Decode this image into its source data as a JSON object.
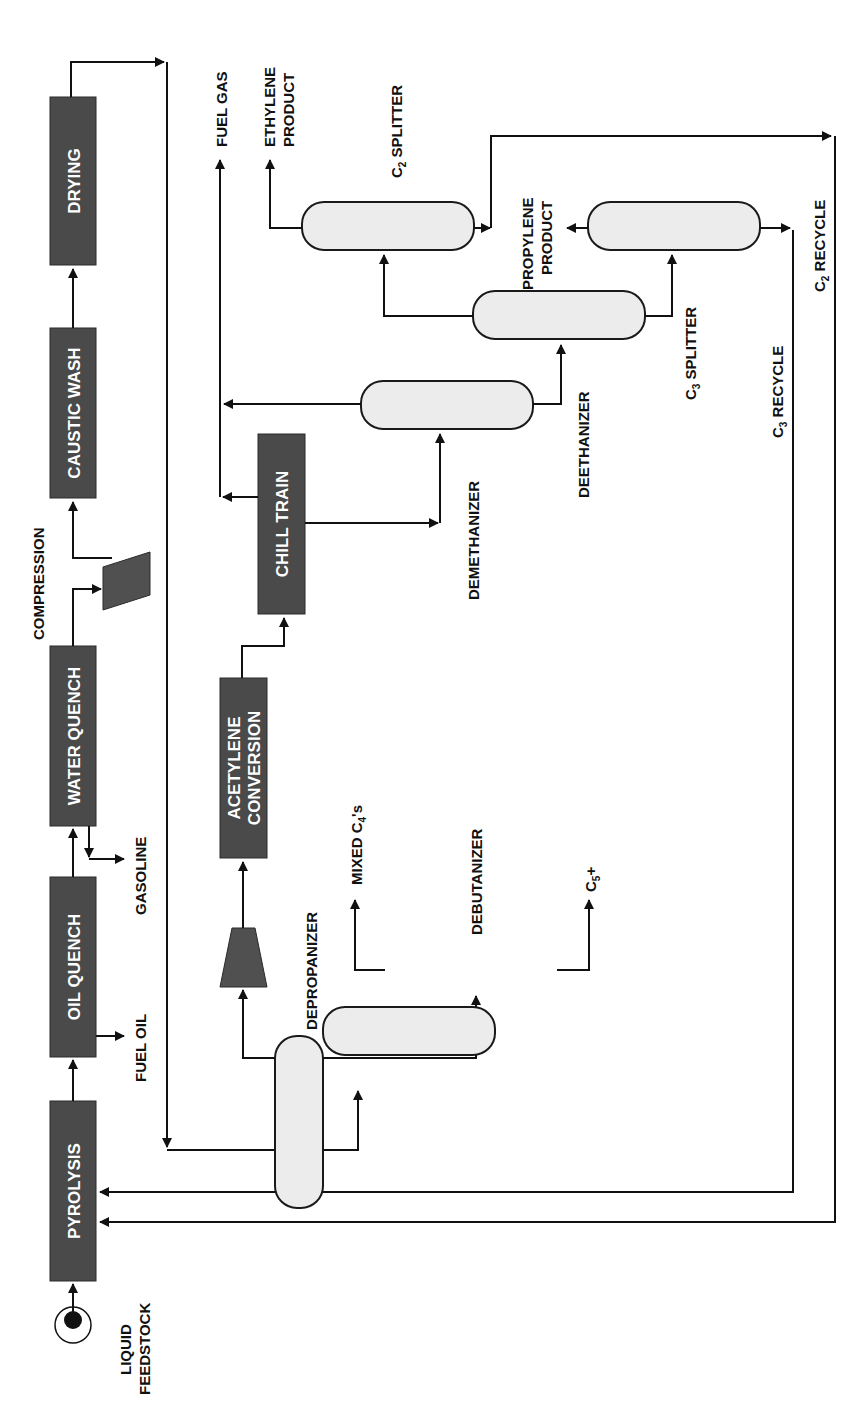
{
  "diagram": {
    "orientation": "rotated-90-ccw",
    "colors": {
      "block_fill": "#4a4a4a",
      "block_text": "#ffffff",
      "column_fill": "#ececec",
      "line": "#111111",
      "background": "#ffffff"
    },
    "feed": {
      "label_line1": "LIQUID",
      "label_line2": "FEEDSTOCK"
    },
    "blocks": {
      "pyrolysis": "PYROLYSIS",
      "oil_quench": "OIL QUENCH",
      "water_quench": "WATER QUENCH",
      "caustic_wash": "CAUSTIC WASH",
      "drying": "DRYING",
      "acetylene_line1": "ACETYLENE",
      "acetylene_line2": "CONVERSION",
      "chill_train": "CHILL TRAIN"
    },
    "compressors": {
      "main_label": "COMPRESSION"
    },
    "columns": {
      "depropanizer": "DEPROPANIZER",
      "debutanizer": "DEBUTANIZER",
      "demethanizer": "DEMETHANIZER",
      "deethanizer": "DEETHANIZER",
      "c3_splitter_c": "C",
      "c3_splitter_sub": "3",
      "c3_splitter_rest": " SPLITTER",
      "c2_splitter_c": "C",
      "c2_splitter_sub": "2",
      "c2_splitter_rest": " SPLITTER"
    },
    "streams": {
      "fuel_oil": "FUEL OIL",
      "gasoline": "GASOLINE",
      "fuel_gas": "FUEL GAS",
      "ethylene_line1": "ETHYLENE",
      "ethylene_line2": "PRODUCT",
      "propylene_line1": "PROPYLENE",
      "propylene_line2": "PRODUCT",
      "mixed_c4_pre": "MIXED C",
      "mixed_c4_sub": "4",
      "mixed_c4_post": "'s",
      "c5_c": "C",
      "c5_sub": "5",
      "c5_post": "+",
      "c3_recycle_c": "C",
      "c3_recycle_sub": "3",
      "c3_recycle_rest": " RECYCLE",
      "c2_recycle_c": "C",
      "c2_recycle_sub": "2",
      "c2_recycle_rest": " RECYCLE"
    }
  }
}
